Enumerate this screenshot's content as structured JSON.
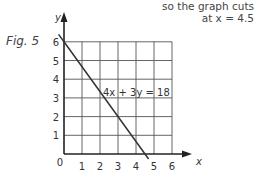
{
  "annotation": {
    "line1": "so the graph cuts",
    "line2": "at x = 4.5"
  },
  "figure_label": "Fig. 5",
  "chart_data": {
    "type": "line",
    "title": "",
    "xlabel": "x",
    "ylabel": "y",
    "xlim": [
      0,
      6
    ],
    "ylim": [
      0,
      6
    ],
    "grid": true,
    "origin_label": "0",
    "x_ticks": [
      "1",
      "2",
      "3",
      "4",
      "5",
      "6"
    ],
    "y_ticks": [
      "1",
      "2",
      "3",
      "4",
      "5",
      "6"
    ],
    "series": [
      {
        "name": "4x + 3y = 18",
        "x": [
          -0.3,
          0,
          4.5,
          4.7
        ],
        "y": [
          6.4,
          6,
          0,
          -0.27
        ]
      }
    ],
    "line_label": "4x + 3y = 18",
    "annotations": [
      "so the graph cuts at x = 4.5"
    ]
  }
}
